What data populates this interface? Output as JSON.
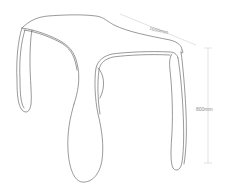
{
  "diagram": {
    "dimensions": {
      "width_label": "1600mm",
      "height_label": "800mm"
    },
    "colors": {
      "background": "#ffffff",
      "outline": "#555555",
      "dimension_line": "#bbbbbb",
      "dimension_text": "#8a8a8a"
    }
  }
}
